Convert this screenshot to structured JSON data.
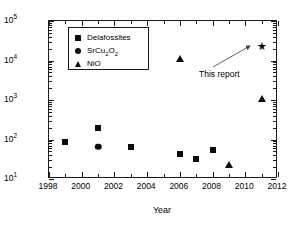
{
  "chart_data": {
    "type": "scatter",
    "title": "",
    "xlabel": "Year",
    "ylabel": "Forward / reverse current ratio",
    "xlim": [
      1998,
      2012
    ],
    "ylim": [
      10,
      100000
    ],
    "yscale": "log",
    "xticks": [
      1998,
      2000,
      2002,
      2004,
      2006,
      2008,
      2010,
      2012
    ],
    "xtick_labels": [
      "1998",
      "2000",
      "2002",
      "2004",
      "2006",
      "2008",
      "2010",
      "2012"
    ],
    "yticks": [
      10,
      100,
      1000,
      10000,
      100000
    ],
    "ytick_labels": [
      "10",
      "10",
      "10",
      "10",
      "10"
    ],
    "ytick_exponents": [
      "1",
      "2",
      "3",
      "4",
      "5"
    ],
    "grid": false,
    "legend_position": "upper left",
    "series": [
      {
        "name": "Delafossites",
        "marker": "square",
        "color": "#0d0d0d",
        "points": [
          {
            "x": 1999,
            "y": 85
          },
          {
            "x": 2001,
            "y": 200
          },
          {
            "x": 2003,
            "y": 65
          },
          {
            "x": 2006,
            "y": 44
          },
          {
            "x": 2007,
            "y": 33
          },
          {
            "x": 2008,
            "y": 55
          }
        ]
      },
      {
        "name": "SrCu2O2",
        "label_html": "SrCu<sub>2</sub>O<sub>2</sub>",
        "marker": "circle",
        "color": "#0d0d0d",
        "points": [
          {
            "x": 2001,
            "y": 65
          }
        ]
      },
      {
        "name": "NiO",
        "marker": "triangle",
        "color": "#0d0d0d",
        "points": [
          {
            "x": 2006,
            "y": 11000
          },
          {
            "x": 2009,
            "y": 22
          },
          {
            "x": 2011,
            "y": 1050
          }
        ]
      },
      {
        "name": "This report",
        "marker": "star",
        "color": "#0d0d0d",
        "points": [
          {
            "x": 2011,
            "y": 22000
          }
        ]
      }
    ],
    "annotations": [
      {
        "text": "This report",
        "target_x": 2011,
        "target_y": 22000
      }
    ]
  },
  "legend": {
    "items": [
      {
        "label": "Delafossites",
        "marker": "square"
      },
      {
        "label_prefix": "SrCu",
        "label_sub1": "2",
        "label_mid": "O",
        "label_sub2": "2",
        "marker": "circle"
      },
      {
        "label": "NiO",
        "marker": "triangle"
      }
    ]
  },
  "axis_titles": {
    "x": "Year",
    "y": "Forward / reverse current ratio"
  },
  "annotation": {
    "text": "This report"
  },
  "star_glyph": "★"
}
